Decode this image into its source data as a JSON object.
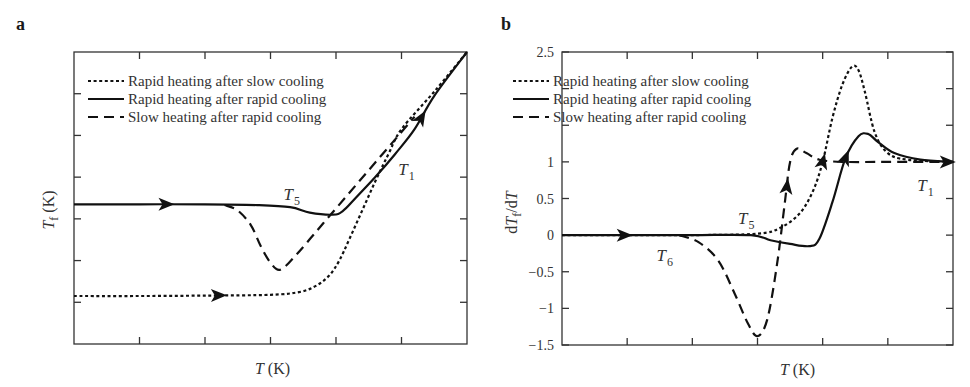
{
  "legend": {
    "dotted": "Rapid heating after slow cooling",
    "solid": "Rapid heating after rapid cooling",
    "dashed": "Slow heating after rapid cooling"
  },
  "chart_data": [
    {
      "panel": "a",
      "type": "line",
      "title": "",
      "xlabel": "T (K)",
      "ylabel": "T_f (K)",
      "xlim": [
        0,
        6
      ],
      "ylim": [
        0,
        7
      ],
      "x_ticks_unlabeled": [
        1,
        2,
        3,
        4,
        5
      ],
      "y_ticks_unlabeled": [
        1,
        2,
        3,
        4,
        5,
        6
      ],
      "grid": false,
      "legend_position": "upper left",
      "annotations": [
        {
          "text": "T",
          "sub": "5",
          "x": 3.2,
          "y": 3.45
        },
        {
          "text": "T",
          "sub": "1",
          "x": 4.95,
          "y": 4.05
        }
      ],
      "series": [
        {
          "name": "Rapid heating after slow cooling",
          "style": "dotted",
          "x": [
            0,
            1.0,
            2.0,
            3.0,
            3.45,
            3.7,
            3.9,
            4.05,
            4.2,
            4.4,
            4.6,
            4.8,
            5.0,
            5.5,
            6.0
          ],
          "y": [
            1.15,
            1.15,
            1.16,
            1.18,
            1.25,
            1.4,
            1.65,
            2.0,
            2.5,
            3.2,
            3.9,
            4.55,
            5.15,
            6.05,
            7.0
          ],
          "arrows_at_x": [
            2.2
          ]
        },
        {
          "name": "Rapid heating after rapid cooling",
          "style": "solid",
          "x": [
            0,
            1.0,
            2.0,
            2.8,
            3.3,
            3.6,
            3.95,
            4.1,
            4.3,
            4.6,
            4.9,
            5.2,
            5.5,
            6.0
          ],
          "y": [
            3.35,
            3.35,
            3.35,
            3.33,
            3.28,
            3.15,
            3.1,
            3.18,
            3.5,
            4.0,
            4.55,
            5.15,
            5.95,
            7.0
          ],
          "arrows_at_x": [
            1.4,
            5.3
          ]
        },
        {
          "name": "Slow heating after rapid cooling",
          "style": "dashed",
          "x": [
            2.3,
            2.5,
            2.7,
            2.85,
            3.0,
            3.15,
            3.4,
            3.7,
            4.0,
            4.3,
            4.6,
            4.9,
            5.2
          ],
          "y": [
            3.33,
            3.2,
            2.85,
            2.35,
            1.95,
            1.78,
            2.15,
            2.7,
            3.25,
            3.8,
            4.35,
            4.9,
            5.45
          ],
          "arrows_at_x": []
        }
      ]
    },
    {
      "panel": "b",
      "type": "line",
      "title": "",
      "xlabel": "T (K)",
      "ylabel": "dT_f/dT",
      "xlim": [
        0,
        6
      ],
      "ylim": [
        -1.5,
        2.5
      ],
      "y_tick_labels": [
        "2.5",
        "1",
        "0.5",
        "0",
        "-0.5",
        "-1",
        "-1.5"
      ],
      "y_ticks": [
        2.5,
        2.0,
        1.5,
        1.0,
        0.5,
        0,
        -0.5,
        -1.0,
        -1.5
      ],
      "x_ticks_unlabeled": [
        1,
        2,
        3,
        4,
        5
      ],
      "grid": false,
      "legend_position": "upper left",
      "annotations": [
        {
          "text": "T",
          "sub": "5",
          "x": 2.7,
          "y": 0.15
        },
        {
          "text": "T",
          "sub": "6",
          "x": 1.45,
          "y": -0.35
        },
        {
          "text": "T",
          "sub": "1",
          "x": 5.45,
          "y": 0.6
        }
      ],
      "series": [
        {
          "name": "Rapid heating after slow cooling",
          "style": "dotted",
          "x": [
            0,
            1.0,
            2.0,
            3.0,
            3.35,
            3.65,
            3.85,
            4.0,
            4.15,
            4.3,
            4.45,
            4.55,
            4.65,
            4.8,
            5.0,
            5.3,
            6.0
          ],
          "y": [
            0,
            0,
            0,
            0.02,
            0.1,
            0.3,
            0.6,
            1.0,
            1.6,
            2.05,
            2.3,
            2.25,
            1.95,
            1.4,
            1.12,
            1.03,
            1.0
          ],
          "arrows_at_x": [
            4.0
          ]
        },
        {
          "name": "Rapid heating after rapid cooling",
          "style": "solid",
          "x": [
            0,
            1.0,
            2.0,
            2.9,
            3.2,
            3.5,
            3.8,
            3.95,
            4.15,
            4.35,
            4.55,
            4.7,
            4.85,
            5.1,
            5.5,
            6.0
          ],
          "y": [
            0,
            0,
            0,
            0,
            -0.07,
            -0.12,
            -0.15,
            -0.05,
            0.45,
            1.05,
            1.35,
            1.38,
            1.27,
            1.12,
            1.03,
            1.0
          ],
          "arrows_at_x": [
            0.95,
            4.35
          ]
        },
        {
          "name": "Slow heating after rapid cooling",
          "style": "dashed",
          "x": [
            1.8,
            2.1,
            2.4,
            2.65,
            2.85,
            3.0,
            3.15,
            3.3,
            3.42,
            3.5,
            3.6,
            3.75,
            3.95,
            4.3,
            5.0,
            6.0
          ],
          "y": [
            0,
            -0.1,
            -0.35,
            -0.8,
            -1.2,
            -1.38,
            -1.15,
            -0.4,
            0.45,
            1.0,
            1.18,
            1.12,
            1.03,
            1.0,
            1.0,
            1.0
          ],
          "arrows_at_x": [
            3.45,
            6.0
          ]
        }
      ]
    }
  ]
}
